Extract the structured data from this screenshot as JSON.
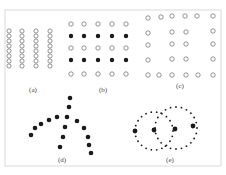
{
  "figure": {
    "frame": {
      "x": 5,
      "y": 10,
      "width": 216,
      "height": 156,
      "color": "#cfcfcf"
    },
    "dot_color": "#1a1a1a",
    "hollow_stroke": "#777777",
    "panels": [
      {
        "id": "a",
        "label": "(a)",
        "label_pos": [
          33,
          92
        ],
        "description": "four vertical columns of densely packed hollow circles",
        "columns_x": [
          9,
          22,
          36,
          50
        ],
        "rows_y": [
          31,
          36,
          41,
          46,
          51,
          56,
          61,
          66
        ],
        "radius": 2.1,
        "fill": "hollow"
      },
      {
        "id": "b",
        "label": "(b)",
        "label_pos": [
          103,
          92
        ],
        "description": "5x5 grid, rows alternating hollow and filled",
        "columns_x": [
          71,
          84,
          98,
          112,
          126
        ],
        "rows": [
          {
            "y": 24,
            "fill": "hollow"
          },
          {
            "y": 36,
            "fill": "filled"
          },
          {
            "y": 48,
            "fill": "hollow"
          },
          {
            "y": 60,
            "fill": "filled"
          },
          {
            "y": 74,
            "fill": "hollow"
          }
        ],
        "radius": 2.2
      },
      {
        "id": "c",
        "label": "(c)",
        "label_pos": [
          180,
          88
        ],
        "description": "hollow circles forming a frame with two inner columns",
        "points": [
          [
            148,
            18
          ],
          [
            161,
            17
          ],
          [
            172,
            16
          ],
          [
            185,
            16
          ],
          [
            197,
            16
          ],
          [
            213,
            16
          ],
          [
            148,
            33
          ],
          [
            172,
            32
          ],
          [
            186,
            32
          ],
          [
            213,
            31
          ],
          [
            148,
            45
          ],
          [
            172,
            44
          ],
          [
            186,
            44
          ],
          [
            213,
            44
          ],
          [
            148,
            60
          ],
          [
            172,
            59
          ],
          [
            186,
            59
          ],
          [
            213,
            59
          ],
          [
            148,
            75
          ],
          [
            159,
            75
          ],
          [
            172,
            75
          ],
          [
            186,
            75
          ],
          [
            198,
            75
          ],
          [
            213,
            75
          ]
        ],
        "radius": 2.2,
        "fill": "hollow"
      },
      {
        "id": "d",
        "label": "(d)",
        "label_pos": [
          62,
          162
        ],
        "description": "branching tree of filled dots",
        "points": [
          [
            70,
            98
          ],
          [
            69,
            107
          ],
          [
            67,
            117
          ],
          [
            57,
            117
          ],
          [
            49,
            120
          ],
          [
            41,
            124
          ],
          [
            35,
            128
          ],
          [
            31,
            135
          ],
          [
            65,
            127
          ],
          [
            63,
            137
          ],
          [
            60,
            147
          ],
          [
            77,
            121
          ],
          [
            84,
            128
          ],
          [
            88,
            137
          ],
          [
            89,
            145
          ],
          [
            91,
            153
          ]
        ],
        "radius": 2.3,
        "fill": "filled"
      },
      {
        "id": "e",
        "label": "(e)",
        "label_pos": [
          170,
          162
        ],
        "description": "two overlapping dotted circles with four large filled points",
        "rings": [
          {
            "cx": 154,
            "cy": 131,
            "r": 19,
            "count": 22
          },
          {
            "cx": 176,
            "cy": 128,
            "r": 21,
            "count": 24
          }
        ],
        "small_radius": 0.9,
        "big_points": [
          [
            135,
            131
          ],
          [
            154,
            130
          ],
          [
            175,
            129
          ],
          [
            193,
            126
          ]
        ],
        "big_radius": 2.4
      }
    ]
  }
}
